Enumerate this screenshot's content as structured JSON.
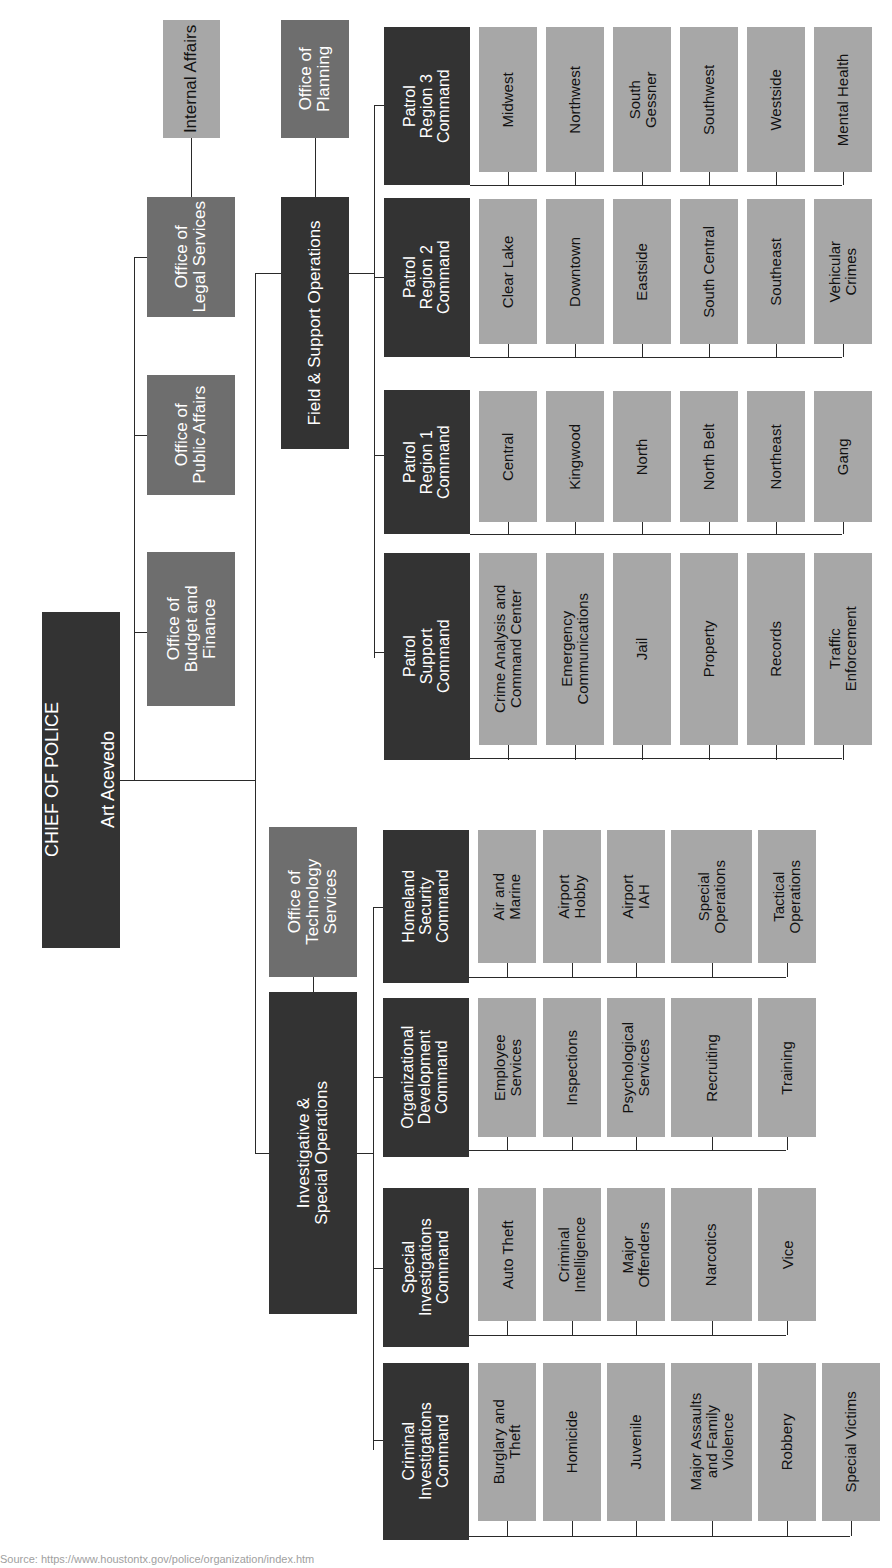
{
  "chief": {
    "title": "CHIEF OF POLICE",
    "name": "Art Acevedo"
  },
  "offices": {
    "budget": "Office of\nBudget and\nFinance",
    "public_affairs": "Office of\nPublic Affairs",
    "legal": "Office of\nLegal Services",
    "internal_affairs": "Internal Affairs",
    "planning": "Office of\nPlanning",
    "technology": "Office of\nTechnology\nServices"
  },
  "divisions": {
    "field_support": "Field & Support Operations",
    "investigative": "Investigative &\nSpecial Operations"
  },
  "field_commands": [
    {
      "name": "Patrol\nRegion 3\nCommand",
      "units": [
        "Midwest",
        "Northwest",
        "South\nGessner",
        "Southwest",
        "Westside",
        "Mental Health"
      ]
    },
    {
      "name": "Patrol\nRegion 2\nCommand",
      "units": [
        "Clear Lake",
        "Downtown",
        "Eastside",
        "South Central",
        "Southeast",
        "Vehicular\nCrimes"
      ]
    },
    {
      "name": "Patrol\nRegion 1\nCommand",
      "units": [
        "Central",
        "Kingwood",
        "North",
        "North Belt",
        "Northeast",
        "Gang"
      ]
    },
    {
      "name": "Patrol\nSupport\nCommand",
      "units": [
        "Crime Analysis and\nCommand Center",
        "Emergency\nCommunications",
        "Jail",
        "Property",
        "Records",
        "Traffic\nEnforcement"
      ]
    }
  ],
  "investigative_commands": [
    {
      "name": "Homeland\nSecurity\nCommand",
      "units": [
        "Air and\nMarine",
        "Airport\nHobby",
        "Airport\nIAH",
        "Special\nOperations",
        "Tactical\nOperations"
      ]
    },
    {
      "name": "Organizational\nDevelopment\nCommand",
      "units": [
        "Employee\nServices",
        "Inspections",
        "Psychological\nServices",
        "Recruiting",
        "Training"
      ]
    },
    {
      "name": "Special\nInvestigations\nCommand",
      "units": [
        "Auto Theft",
        "Criminal\nIntelligence",
        "Major\nOffenders",
        "Narcotics",
        "Vice"
      ]
    },
    {
      "name": "Criminal\nInvestigations\nCommand",
      "units": [
        "Burglary and\nTheft",
        "Homicide",
        "Juvenile",
        "Major Assaults\nand Family\nViolence",
        "Robbery",
        "Special Victims"
      ]
    }
  ],
  "source": "Source: https://www.houstontx.gov/police/organization/index.htm",
  "colors": {
    "dark": "#333333",
    "mid": "#6e6e6e",
    "light": "#a7a7a7",
    "line": "#2a2a2a"
  }
}
